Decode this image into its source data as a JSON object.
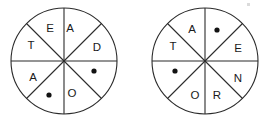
{
  "figure": {
    "kind": "two-spinner-wheels",
    "background_color": "#ffffff",
    "line_color": "#2b2b2b",
    "text_color": "#1a1a1a",
    "dot_color": "#121212"
  },
  "spinners": [
    {
      "name": "left-spinner",
      "center_x": 64,
      "center_y": 61,
      "radius": 53,
      "sector_count": 8,
      "sectors": [
        {
          "index": 0,
          "position": "top-right-inner",
          "type": "letter",
          "value": "A",
          "label_x": 70,
          "label_y": 28
        },
        {
          "index": 1,
          "position": "right-upper",
          "type": "letter",
          "value": "D",
          "label_x": 97,
          "label_y": 47
        },
        {
          "index": 2,
          "position": "right-lower",
          "type": "dot",
          "value": "●",
          "label_x": 94,
          "label_y": 71
        },
        {
          "index": 3,
          "position": "bottom-right-inner",
          "type": "letter",
          "value": "O",
          "label_x": 72,
          "label_y": 93
        },
        {
          "index": 4,
          "position": "bottom-left-inner",
          "type": "dot",
          "value": "●",
          "label_x": 49,
          "label_y": 95
        },
        {
          "index": 5,
          "position": "left-lower",
          "type": "letter",
          "value": "A",
          "label_x": 33,
          "label_y": 77
        },
        {
          "index": 6,
          "position": "left-upper",
          "type": "letter",
          "value": "T",
          "label_x": 31,
          "label_y": 45
        },
        {
          "index": 7,
          "position": "top-left-inner",
          "type": "letter",
          "value": "E",
          "label_x": 50,
          "label_y": 28
        }
      ]
    },
    {
      "name": "right-spinner",
      "center_x": 205,
      "center_y": 61,
      "radius": 53,
      "sector_count": 8,
      "sectors": [
        {
          "index": 0,
          "position": "top-right-inner",
          "type": "dot",
          "value": "●",
          "label_x": 217,
          "label_y": 30
        },
        {
          "index": 1,
          "position": "right-upper",
          "type": "letter",
          "value": "E",
          "label_x": 238,
          "label_y": 48
        },
        {
          "index": 2,
          "position": "right-lower",
          "type": "letter",
          "value": "N",
          "label_x": 238,
          "label_y": 78
        },
        {
          "index": 3,
          "position": "bottom-right-inner",
          "type": "letter",
          "value": "R",
          "label_x": 217,
          "label_y": 95
        },
        {
          "index": 4,
          "position": "bottom-left-inner",
          "type": "letter",
          "value": "O",
          "label_x": 195,
          "label_y": 95
        },
        {
          "index": 5,
          "position": "left-lower",
          "type": "dot",
          "value": "●",
          "label_x": 175,
          "label_y": 71
        },
        {
          "index": 6,
          "position": "left-upper",
          "type": "letter",
          "value": "T",
          "label_x": 173,
          "label_y": 46
        },
        {
          "index": 7,
          "position": "top-left-inner",
          "type": "letter",
          "value": "A",
          "label_x": 192,
          "label_y": 29
        }
      ]
    }
  ],
  "artifacts": [
    {
      "name": "scan-speck-top-right",
      "x": 247,
      "y": 3,
      "w": 3,
      "h": 3
    }
  ]
}
